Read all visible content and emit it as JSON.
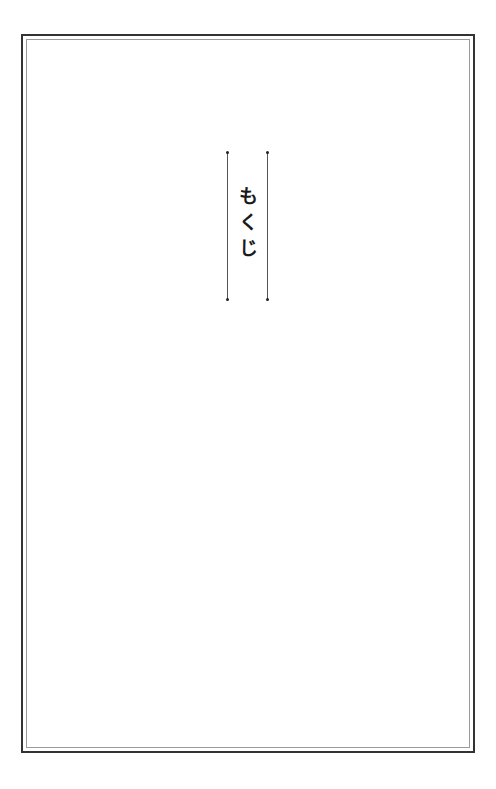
{
  "page": {
    "title": "もくじ",
    "frame_color": "#333333",
    "inner_frame_color": "#9a9a9a",
    "rule_color": "#555555"
  }
}
